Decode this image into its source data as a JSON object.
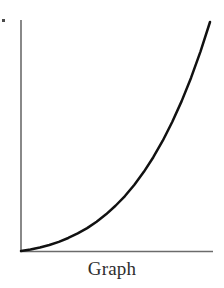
{
  "figure": {
    "caption": "Graph",
    "background_color": "#ffffff",
    "caption_color": "#2e2e2e",
    "speck_name": "scan-speck"
  },
  "chart_data": {
    "type": "line",
    "title": "Graph",
    "subtitle": "",
    "xlabel": "",
    "ylabel": "",
    "xlim": [
      0,
      10
    ],
    "ylim": [
      0,
      10
    ],
    "grid": false,
    "legend": false,
    "axis_color": "#6b6b6b",
    "line_color": "#111111",
    "line_width": 2.5,
    "series": [
      {
        "name": "exponential curve",
        "x": [
          0.0,
          0.5,
          1.0,
          1.5,
          2.0,
          2.5,
          3.0,
          3.5,
          4.0,
          4.5,
          5.0,
          5.5,
          6.0,
          6.5,
          7.0,
          7.5,
          8.0,
          8.5,
          9.0,
          9.5,
          10.0
        ],
        "y": [
          0.0,
          0.08,
          0.19,
          0.33,
          0.5,
          0.71,
          0.96,
          1.25,
          1.6,
          2.0,
          2.47,
          3.0,
          3.62,
          4.32,
          5.12,
          6.02,
          7.04,
          8.18,
          9.46,
          10.9,
          12.5
        ]
      }
    ],
    "axes": {
      "y_axis": {
        "x": 0,
        "y_from": 0,
        "y_to": 10
      },
      "x_axis": {
        "y": 0,
        "x_from": 0,
        "x_to": 10
      }
    }
  }
}
